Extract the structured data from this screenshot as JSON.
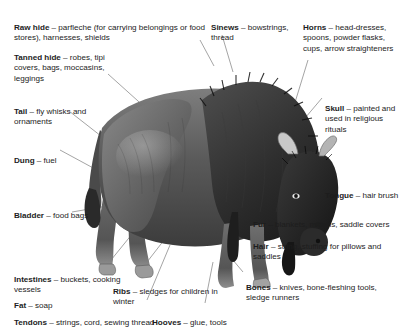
{
  "figure": {
    "background_color": "#ffffff",
    "text_color": "#1d1d1d",
    "line_color": "#8d8d8d"
  },
  "labels": {
    "raw_hide": {
      "term": "Raw hide",
      "dash": " – ",
      "uses": "parfleche (for carrying belongings or food stores), harnesses, shields"
    },
    "tanned_hide": {
      "term": "Tanned hide",
      "dash": " – ",
      "uses": "robes, tipi covers, bags, moccasins, leggings"
    },
    "tail": {
      "term": "Tail",
      "dash": " – ",
      "uses": "fly whisks and ornaments"
    },
    "dung": {
      "term": "Dung",
      "dash": " – ",
      "uses": "fuel"
    },
    "bladder": {
      "term": "Bladder",
      "dash": " – ",
      "uses": "food bags"
    },
    "intestines": {
      "term": "Intestines",
      "dash": " – ",
      "uses": "buckets, cooking vessels"
    },
    "fat": {
      "term": "Fat",
      "dash": " – ",
      "uses": "soap"
    },
    "tendons": {
      "term": "Tendons",
      "dash": " – ",
      "uses": "strings, cord, sewing thread"
    },
    "ribs": {
      "term": "Ribs",
      "dash": " – ",
      "uses": "sledges for children in winter"
    },
    "sinews": {
      "term": "Sinews",
      "dash": " – ",
      "uses": "bowstrings, thread"
    },
    "horns": {
      "term": "Horns",
      "dash": " – ",
      "uses": "head-dresses, spoons, powder flasks, cups, arrow straighteners"
    },
    "skull": {
      "term": "Skull",
      "dash": " – ",
      "uses": "painted and used in religious rituals"
    },
    "tongue": {
      "term": "Tongue",
      "dash": " – ",
      "uses": "hair brush"
    },
    "fur": {
      "term": "Fur",
      "dash": " – ",
      "uses": "blankets, mittens, saddle covers"
    },
    "hair": {
      "term": "Hair",
      "dash": " – ",
      "uses": "string, stuffing for pillows and saddles"
    },
    "bones": {
      "term": "Bones",
      "dash": " – ",
      "uses": "knives, bone-fleshing tools, sledge runners"
    },
    "hooves": {
      "term": "Hooves",
      "dash": " – ",
      "uses": "glue, tools"
    }
  }
}
